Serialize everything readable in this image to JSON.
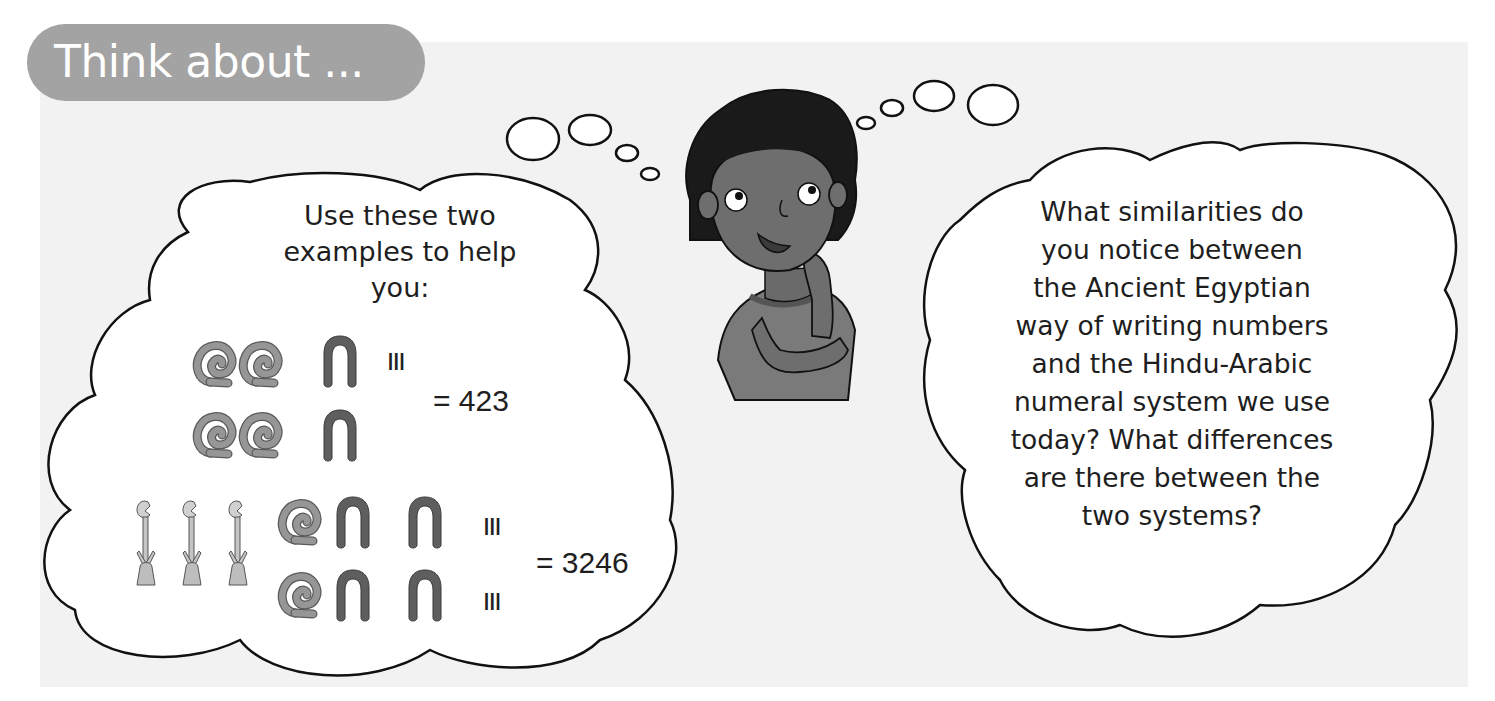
{
  "header": {
    "title": "Think about ..."
  },
  "left_cloud": {
    "prompt_lines": [
      "Use these two",
      "examples to help",
      "you:"
    ],
    "examples": [
      {
        "rows": [
          {
            "glyphs": [
              "coil-100",
              "coil-100",
              "heel-10"
            ],
            "strokes": "III"
          },
          {
            "glyphs": [
              "coil-100",
              "coil-100",
              "heel-10"
            ],
            "strokes": ""
          }
        ],
        "equals": "= 423",
        "value": 423
      },
      {
        "lead_glyphs": [
          "lotus-1000",
          "lotus-1000",
          "lotus-1000"
        ],
        "rows": [
          {
            "glyphs": [
              "coil-100",
              "heel-10",
              "heel-10"
            ],
            "strokes": "III"
          },
          {
            "glyphs": [
              "coil-100",
              "heel-10",
              "heel-10"
            ],
            "strokes": "III"
          }
        ],
        "equals": "= 3246",
        "value": 3246
      }
    ]
  },
  "right_cloud": {
    "question_lines": [
      "What similarities do",
      "you notice between",
      "the Ancient Egyptian",
      "way of writing numbers",
      "and the Hindu-Arabic",
      "numeral system we use",
      "today? What differences",
      "are there between the",
      "two systems?"
    ]
  },
  "colors": {
    "panel_bg": "#f2f2f2",
    "title_pill": "#a3a3a3",
    "coil": "#8f8f8f",
    "heel": "#5e5e5e",
    "lotus": "#c4c4c4",
    "outline": "#111111",
    "skin": "#6e6e6e",
    "hair": "#1a1a1a",
    "shirt": "#7a7a7a"
  }
}
